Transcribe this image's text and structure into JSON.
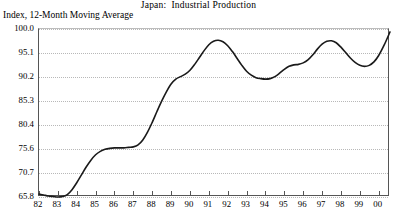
{
  "chart_data": {
    "type": "line",
    "title": "Japan:  Industrial Production",
    "ylabel": "Index, 12-Month Moving Average",
    "xlabel": "",
    "grid": true,
    "legend": "none",
    "ylim": [
      65.8,
      100.0
    ],
    "xlim": [
      1982.0,
      2000.6
    ],
    "ytick_labels": [
      "100.0",
      "95.1",
      "90.2",
      "85.3",
      "80.4",
      "75.6",
      "70.7",
      "65.8"
    ],
    "ytick_values": [
      100.0,
      95.1,
      90.2,
      85.3,
      80.4,
      75.6,
      70.7,
      65.8
    ],
    "xtick_labels": [
      "82",
      "83",
      "84",
      "85",
      "86",
      "87",
      "88",
      "89",
      "90",
      "91",
      "92",
      "93",
      "94",
      "95",
      "96",
      "97",
      "98",
      "99",
      "00"
    ],
    "xtick_values": [
      1982,
      1983,
      1984,
      1985,
      1986,
      1987,
      1988,
      1989,
      1990,
      1991,
      1992,
      1993,
      1994,
      1995,
      1996,
      1997,
      1998,
      1999,
      2000
    ],
    "series": [
      {
        "name": "Industrial Production",
        "color": "#1a1a1a",
        "x": [
          1982.0,
          1982.25,
          1982.5,
          1982.75,
          1983.0,
          1983.25,
          1983.5,
          1983.75,
          1984.0,
          1984.25,
          1984.5,
          1984.75,
          1985.0,
          1985.25,
          1985.5,
          1985.75,
          1986.0,
          1986.25,
          1986.5,
          1986.75,
          1987.0,
          1987.25,
          1987.5,
          1987.75,
          1988.0,
          1988.25,
          1988.5,
          1988.75,
          1989.0,
          1989.25,
          1989.5,
          1989.75,
          1990.0,
          1990.25,
          1990.5,
          1990.75,
          1991.0,
          1991.25,
          1991.5,
          1991.75,
          1992.0,
          1992.25,
          1992.5,
          1992.75,
          1993.0,
          1993.25,
          1993.5,
          1993.75,
          1994.0,
          1994.25,
          1994.5,
          1994.75,
          1995.0,
          1995.25,
          1995.5,
          1995.75,
          1996.0,
          1996.25,
          1996.5,
          1996.75,
          1997.0,
          1997.25,
          1997.5,
          1997.75,
          1998.0,
          1998.25,
          1998.5,
          1998.75,
          1999.0,
          1999.25,
          1999.5,
          1999.75,
          2000.0,
          2000.3,
          2000.6
        ],
        "y": [
          66.4,
          66.2,
          66.0,
          65.9,
          65.8,
          65.9,
          66.3,
          67.3,
          68.7,
          70.3,
          71.9,
          73.3,
          74.4,
          75.1,
          75.5,
          75.7,
          75.8,
          75.8,
          75.8,
          75.9,
          76.0,
          76.4,
          77.4,
          79.0,
          81.0,
          83.2,
          85.3,
          87.2,
          88.8,
          89.8,
          90.3,
          90.8,
          91.6,
          92.8,
          94.2,
          95.6,
          96.8,
          97.5,
          97.7,
          97.4,
          96.6,
          95.4,
          94.0,
          92.6,
          91.4,
          90.6,
          90.1,
          89.9,
          89.8,
          89.9,
          90.3,
          91.0,
          91.8,
          92.4,
          92.7,
          92.8,
          93.1,
          93.7,
          94.7,
          95.9,
          96.9,
          97.5,
          97.6,
          97.2,
          96.3,
          95.2,
          94.1,
          93.2,
          92.6,
          92.4,
          92.6,
          93.3,
          94.6,
          96.8,
          99.4
        ]
      }
    ]
  }
}
